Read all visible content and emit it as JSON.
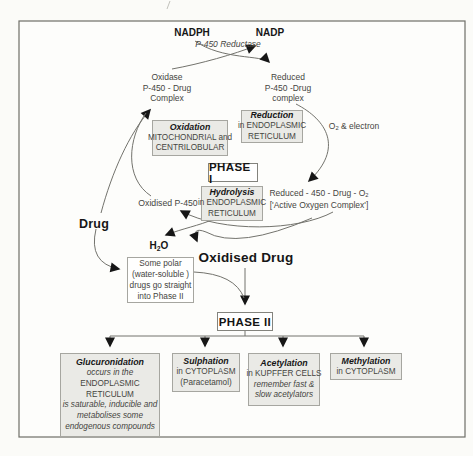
{
  "colors": {
    "box_fill": "#eaeae6",
    "box_border": "#a6a6a0",
    "flow_line": "#73736d",
    "arrow": "#161616",
    "frame": "#6e6e68",
    "text": "#45453f",
    "bold_text": "#161616"
  },
  "cycle": {
    "nadph": "NADPH",
    "nadp": "NADP",
    "reductase": "P-450 Reductase",
    "oxidase_complex": {
      "l1": "Oxidase",
      "l2": "P-450 - Drug",
      "l3": "Complex"
    },
    "reduced_complex": {
      "l1": "Reduced",
      "l2": "P-450 -Drug",
      "l3": "complex"
    },
    "o2_electron": {
      "base": "O",
      "sub": "2",
      "rest": " & electron"
    },
    "active_oxygen": {
      "l1_base": "Reduced - 450 - Drug - O",
      "l1_sub": "2",
      "l2": "['Active Oxygen Complex']"
    },
    "oxidised_p450": "Oxidised P-450",
    "drug": "Drug",
    "h2o": {
      "base": "H",
      "sub": "2",
      "rest": "O"
    },
    "oxidised_drug": "Oxidised Drug"
  },
  "phase1_label": "PHASE I",
  "phase2_label": "PHASE II",
  "boxes": {
    "oxidation": {
      "title": "Oxidation",
      "l1": "MITOCHONDRIAL and",
      "l2": "CENTRILOBULAR"
    },
    "reduction": {
      "title": "Reduction",
      "l1": "in ENDOPLASMIC",
      "l2": "RETICULUM"
    },
    "hydrolysis": {
      "title": "Hydrolysis",
      "l1": "in ENDOPLASMIC",
      "l2": "RETICULUM"
    },
    "some_polar": {
      "l1": "Some polar",
      "l2": "(water-soluble )",
      "l3": "drugs go straight",
      "l4": "into Phase II"
    },
    "glucuronidation": {
      "title": "Glucuronidation",
      "lines": [
        "occurs in the",
        "ENDOPLASMIC",
        "RETICULUM",
        "is saturable, inducible and",
        "metabolises some",
        "endogenous compounds"
      ]
    },
    "sulphation": {
      "title": "Sulphation",
      "lines": [
        "in CYTOPLASM",
        "(Paracetamol)"
      ]
    },
    "acetylation": {
      "title": "Acetylation",
      "lines": [
        "in KUPFFER CELLS",
        "remember fast &",
        "slow acetylators"
      ]
    },
    "methylation": {
      "title": "Methylation",
      "lines": [
        "in CYTOPLASM"
      ]
    }
  }
}
